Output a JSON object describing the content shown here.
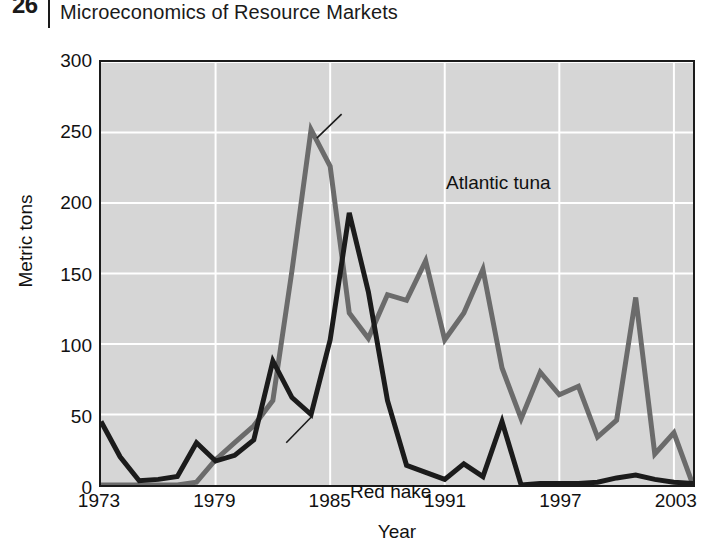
{
  "page": {
    "number": "26",
    "running_head": "Microeconomics of Resource Markets"
  },
  "chart_data": {
    "type": "line",
    "title": "",
    "xlabel": "Year",
    "ylabel": "Metric tons",
    "xlim": [
      1973,
      2004
    ],
    "ylim": [
      0,
      300
    ],
    "grid": true,
    "legend_position": "inline-annotations",
    "x_ticks": [
      "1973",
      "1979",
      "1985",
      "1991",
      "1997",
      "2003"
    ],
    "x_tick_values": [
      1973,
      1979,
      1985,
      1991,
      1997,
      2003
    ],
    "y_ticks": [
      "0",
      "50",
      "100",
      "150",
      "200",
      "250",
      "300"
    ],
    "y_tick_values": [
      0,
      50,
      100,
      150,
      200,
      250,
      300
    ],
    "x": [
      1973,
      1974,
      1975,
      1976,
      1977,
      1978,
      1979,
      1980,
      1981,
      1982,
      1983,
      1984,
      1985,
      1986,
      1987,
      1988,
      1989,
      1990,
      1991,
      1992,
      1993,
      1994,
      1995,
      1996,
      1997,
      1998,
      1999,
      2000,
      2001,
      2002,
      2003,
      2004
    ],
    "series": [
      {
        "name": "Atlantic tuna",
        "color": "#6b6b6b",
        "label_position": {
          "x": 1985.5,
          "y": 262
        },
        "values": [
          0,
          0,
          0,
          0,
          0,
          2,
          18,
          30,
          42,
          60,
          152,
          252,
          226,
          122,
          104,
          135,
          131,
          159,
          103,
          122,
          153,
          83,
          47,
          80,
          64,
          70,
          34,
          46,
          133,
          22,
          37,
          0
        ]
      },
      {
        "name": "Red hake",
        "color": "#1b1b1b",
        "label_position": {
          "x": 1980.8,
          "y": 33
        },
        "values": [
          45,
          20,
          3,
          4,
          6,
          30,
          17,
          21,
          32,
          88,
          62,
          50,
          103,
          193,
          137,
          60,
          14,
          9,
          4,
          15,
          6,
          45,
          0,
          1,
          1,
          1,
          2,
          5,
          7,
          4,
          2,
          1
        ]
      }
    ],
    "annotations": [
      {
        "text": "Atlantic tuna",
        "leader_from": {
          "x": 1984.3,
          "y": 246
        },
        "leader_to": {
          "x": 1985.6,
          "y": 263
        }
      },
      {
        "text": "Red hake",
        "leader_from": {
          "x": 1982.7,
          "y": 30
        },
        "leader_to": {
          "x": 1984.0,
          "y": 48
        }
      }
    ]
  }
}
